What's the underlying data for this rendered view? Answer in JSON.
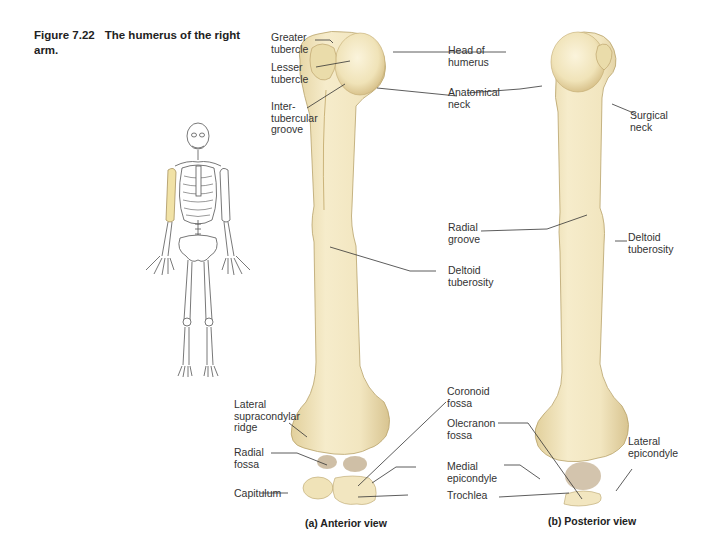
{
  "figure": {
    "number": "Figure 7.22",
    "title": "The humerus of the right arm."
  },
  "colors": {
    "bone_fill": "#f3e9c4",
    "bone_shade": "#dccb98",
    "bone_dark": "#a88a5c",
    "leader_line": "#333333",
    "highlight": "#f1e2a6"
  },
  "anterior": {
    "view_label": "(a) Anterior view",
    "labels": [
      {
        "id": "greater-tubercle",
        "text": "Greater\ntubercle"
      },
      {
        "id": "lesser-tubercle",
        "text": "Lesser\ntubercle"
      },
      {
        "id": "intertubercular-groove",
        "text": "Inter-\ntubercular\ngroove"
      },
      {
        "id": "head-of-humerus",
        "text": "Head of\nhumerus"
      },
      {
        "id": "anatomical-neck",
        "text": "Anatomical\nneck"
      },
      {
        "id": "deltoid-tuberosity",
        "text": "Deltoid\ntuberosity"
      },
      {
        "id": "lateral-supracondylar-ridge",
        "text": "Lateral\nsupracondylar\nridge"
      },
      {
        "id": "radial-fossa",
        "text": "Radial\nfossa"
      },
      {
        "id": "capitulum",
        "text": "Capitulum"
      },
      {
        "id": "coronoid-fossa",
        "text": "Coronoid\nfossa"
      },
      {
        "id": "medial-epicondyle",
        "text": "Medial\nepicondyle"
      },
      {
        "id": "trochlea",
        "text": "Trochlea"
      }
    ]
  },
  "posterior": {
    "view_label": "(b) Posterior view",
    "labels": [
      {
        "id": "surgical-neck",
        "text": "Surgical\nneck"
      },
      {
        "id": "radial-groove",
        "text": "Radial\ngroove"
      },
      {
        "id": "deltoid-tuberosity",
        "text": "Deltoid\ntuberosity"
      },
      {
        "id": "olecranon-fossa",
        "text": "Olecranon\nfossa"
      },
      {
        "id": "lateral-epicondyle",
        "text": "Lateral\nepicondyle"
      }
    ]
  },
  "skeleton_inset": {
    "highlighted_bone": "right humerus"
  }
}
